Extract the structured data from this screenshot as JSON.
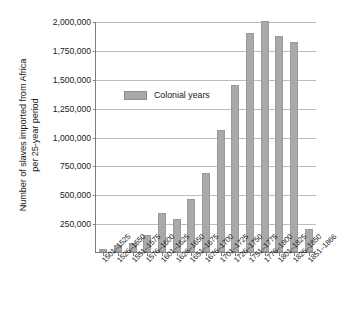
{
  "chart_data": {
    "type": "bar",
    "title": "",
    "subtitle": "",
    "xlabel": "",
    "ylabel": "Number of slaves imported from Africa\nper 25-year period",
    "ylim": [
      0,
      2000000
    ],
    "ytick_values": [
      250000,
      500000,
      750000,
      1000000,
      1250000,
      1500000,
      1750000,
      2000000
    ],
    "ytick_labels": [
      "250,000",
      "500,000",
      "750,000",
      "1,000,000",
      "1,250,000",
      "1,500,000",
      "1,750,000",
      "2,000,000"
    ],
    "grid": true,
    "legend_position": "inside-upper-left",
    "legend": [
      {
        "name": "Colonial years",
        "color": "#a9a9a9"
      }
    ],
    "categories": [
      "1501–1525",
      "1526–1550",
      "1551–1575",
      "1576–1600",
      "1601–1625",
      "1626–1650",
      "1651–1675",
      "1676–1700",
      "1701–1725",
      "1726–1750",
      "1751–1775",
      "1776–1800",
      "1801–1825",
      "1826–1850",
      "1851–1866"
    ],
    "values": [
      30000,
      65000,
      75000,
      145000,
      335000,
      290000,
      455000,
      685000,
      1060000,
      1450000,
      1900000,
      2000000,
      1870000,
      1820000,
      200000
    ],
    "series": [
      {
        "name": "Colonial years",
        "color": "#a9a9a9",
        "values": [
          30000,
          65000,
          75000,
          145000,
          335000,
          290000,
          455000,
          685000,
          1060000,
          1450000,
          1900000,
          2000000,
          1870000,
          1820000,
          200000
        ]
      }
    ],
    "colors": {
      "bar": "#a9a9a9",
      "gridline": "#bcbcbc",
      "axis": "#7d7d7d",
      "text": "#1a1a1a",
      "background": "#ffffff"
    }
  }
}
